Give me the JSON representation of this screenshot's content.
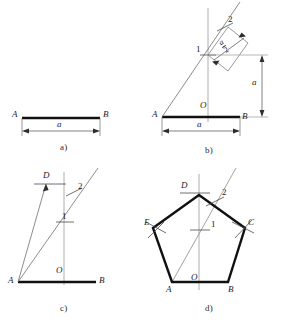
{
  "figure": {
    "side_symbol": "a"
  },
  "panels": [
    {
      "id": "a",
      "caption": "a)",
      "description": "Given segment AB of length a",
      "labels": {
        "A": "A",
        "B": "B",
        "dim": "a"
      }
    },
    {
      "id": "b",
      "caption": "b)",
      "description": "Perpendicular bisector at O, point 1 at height a, ray to point 2 at distance a/2",
      "labels": {
        "A": "A",
        "B": "B",
        "O": "O",
        "p1": "1",
        "p2": "2",
        "dim_h": "a",
        "dim_v": "a",
        "half": {
          "num": "a",
          "den": "2"
        }
      }
    },
    {
      "id": "c",
      "caption": "c)",
      "description": "Arc from A through point 2 locates apex D on the vertical axis",
      "labels": {
        "A": "A",
        "B": "B",
        "O": "O",
        "D": "D",
        "p1": "1",
        "p2": "2"
      }
    },
    {
      "id": "d",
      "caption": "d)",
      "description": "Completed regular pentagon ABCDE",
      "labels": {
        "A": "A",
        "B": "B",
        "C": "C",
        "D": "D",
        "E": "E",
        "O": "O",
        "p1": "1",
        "p2": "2"
      }
    }
  ],
  "colors": {
    "ink": "#1a1a1a",
    "construction": "#6e6e6e",
    "heavy": "#111111",
    "axis": "#8a8a8a"
  }
}
